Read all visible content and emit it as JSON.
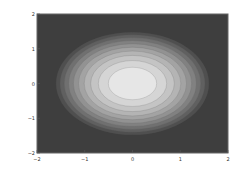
{
  "chart_data": {
    "type": "heatmap",
    "subtype": "filled-contour",
    "title": "",
    "xlabel": "",
    "ylabel": "",
    "xlim": [
      -2,
      2
    ],
    "ylim": [
      -2,
      2
    ],
    "x_ticks": [
      "-2",
      "-1",
      "0",
      "1",
      "2"
    ],
    "y_ticks": [
      "2",
      "1",
      "0",
      "-1",
      "-2"
    ],
    "grid": false,
    "legend": null,
    "function": "Gaussian-like elliptical peak centered at (0,0), wider in x than y",
    "center": [
      0,
      0
    ],
    "contour_levels": 10,
    "outer_contour_semi_axes": [
      1.6,
      1.8
    ],
    "colormap": "grayscale (dark low, light high)",
    "colors": {
      "background": "#3e3e3e",
      "peak": "#e6e6e6",
      "frame": "#555555"
    }
  }
}
